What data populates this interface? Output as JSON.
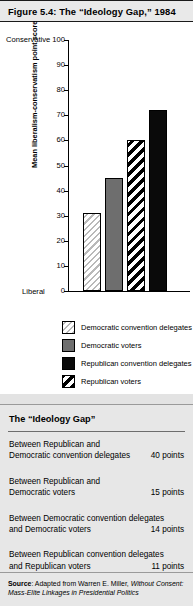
{
  "figure": {
    "title": "Figure 5.4:  The “Ideology Gap,” 1984"
  },
  "chart_data": {
    "type": "bar",
    "title": "The “Ideology Gap,” 1984",
    "xlabel": "",
    "ylabel": "Mean liberalism-conservatism point score",
    "ylim": [
      0,
      100
    ],
    "yticks": [
      0,
      10,
      20,
      30,
      40,
      50,
      60,
      70,
      80,
      90,
      100
    ],
    "axis_high_label": "Conservative",
    "axis_low_label": "Liberal",
    "grid": false,
    "legend_position": "below",
    "categories": [
      "Democratic convention delegates",
      "Democratic voters",
      "Republican voters",
      "Republican convention delegates"
    ],
    "values": [
      31,
      45,
      60,
      72
    ],
    "patterns": [
      "thin-hatch",
      "solid-gray",
      "bold-hatch",
      "solid-black"
    ]
  },
  "legend": {
    "items": [
      {
        "label": "Democratic convention delegates",
        "pattern": "thin-hatch"
      },
      {
        "label": "Democratic voters",
        "pattern": "solid-gray"
      },
      {
        "label": "Republican convention delegates",
        "pattern": "solid-black"
      },
      {
        "label": "Republican voters",
        "pattern": "bold-hatch"
      }
    ]
  },
  "table": {
    "title": "The “Ideology Gap”",
    "rows": [
      {
        "line1": "Between Republican and",
        "line2": "Democratic convention delegates",
        "value": "40 points"
      },
      {
        "line1": "Between Republican and",
        "line2": "Democratic voters",
        "value": "15 points"
      },
      {
        "line1": "Between Democratic convention delegates",
        "line2": "and Democratic voters",
        "value": "14 points"
      },
      {
        "line1": "Between Republican convention delegates",
        "line2": "and Republican voters",
        "value": "11 points"
      }
    ]
  },
  "source": {
    "label": "Source",
    "text": ": Adapted from Warren E. Miller, ",
    "work": "Without Consent: Mass-Elite Linkages in Presidential Politics"
  }
}
